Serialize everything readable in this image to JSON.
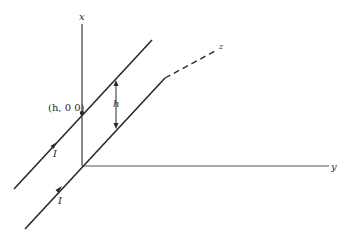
{
  "diagram": {
    "axes": {
      "x_label": "x",
      "y_label": "y",
      "z_label": "z"
    },
    "point_label": "(h, 0 0)",
    "separation_label": "h",
    "current_labels": [
      "I",
      "I"
    ],
    "colors": {
      "line": "#2a2a2a",
      "axis": "#444444",
      "background": "#ffffff"
    }
  }
}
